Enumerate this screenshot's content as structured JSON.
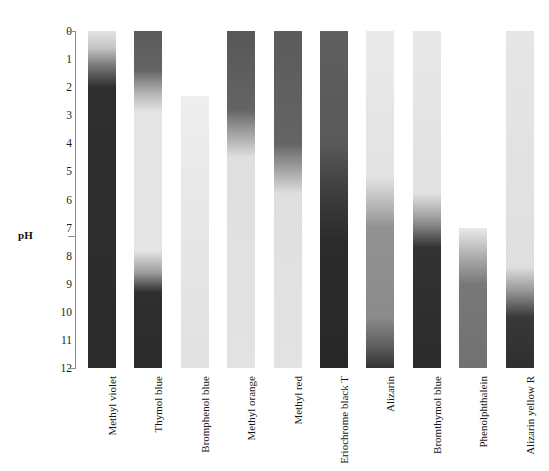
{
  "axis": {
    "title": "pH",
    "ticks": [
      "0",
      "1",
      "2",
      "3",
      "4",
      "5",
      "6",
      "7",
      "8",
      "9",
      "10",
      "11",
      "12"
    ],
    "min": 0,
    "max": 12,
    "capped_ticks": [
      "0",
      "7",
      "12"
    ]
  },
  "chart_data": {
    "type": "heatmap",
    "title": "pH",
    "xlabel": "",
    "ylabel": "pH",
    "ylim": [
      0,
      12
    ],
    "grid": false,
    "legend_position": "none",
    "orientation": "vertical-strips",
    "note": "Grayscale acid-base indicator strips; each strip shows a color (grayscale density) transition across its pH range. 0 = white/light form, 100 = dark form.",
    "categories": [
      "Methyl violet",
      "Thymol blue",
      "Bromphenol blue",
      "Methyl orange",
      "Methyl red",
      "Eriochrome black T",
      "Alizarin",
      "Bromthymol blue",
      "Phenolphthalein",
      "Alizarin yellow R"
    ],
    "series": [
      {
        "name": "Methyl violet",
        "ph_start": 0.0,
        "ph_end": 12.0,
        "transitions": [
          {
            "ph_low": 0.0,
            "ph_high": 2.0,
            "from_density": 8,
            "to_density": 92
          }
        ],
        "stops": [
          {
            "ph": 0.0,
            "density": 8
          },
          {
            "ph": 0.6,
            "density": 22
          },
          {
            "ph": 1.2,
            "density": 55
          },
          {
            "ph": 2.0,
            "density": 90
          },
          {
            "ph": 12.0,
            "density": 92
          }
        ]
      },
      {
        "name": "Thymol blue",
        "ph_start": 0.0,
        "ph_end": 12.0,
        "transitions": [
          {
            "ph_low": 1.2,
            "ph_high": 2.8,
            "from_density": 72,
            "to_density": 7
          },
          {
            "ph_low": 8.0,
            "ph_high": 9.4,
            "from_density": 7,
            "to_density": 92
          }
        ],
        "stops": [
          {
            "ph": 0.0,
            "density": 70
          },
          {
            "ph": 1.4,
            "density": 66
          },
          {
            "ph": 2.2,
            "density": 30
          },
          {
            "ph": 2.9,
            "density": 7
          },
          {
            "ph": 7.8,
            "density": 7
          },
          {
            "ph": 8.6,
            "density": 40
          },
          {
            "ph": 9.3,
            "density": 90
          },
          {
            "ph": 12.0,
            "density": 92
          }
        ]
      },
      {
        "name": "Bromphenol blue",
        "ph_start": 2.3,
        "ph_end": 12.0,
        "transitions": [
          {
            "ph_low": 3.0,
            "ph_high": 4.6,
            "from_density": 4,
            "to_density": 8
          }
        ],
        "stops": [
          {
            "ph": 2.3,
            "density": 3
          },
          {
            "ph": 6.0,
            "density": 6
          },
          {
            "ph": 12.0,
            "density": 9
          }
        ]
      },
      {
        "name": "Methyl orange",
        "ph_start": 0.0,
        "ph_end": 12.0,
        "transitions": [
          {
            "ph_low": 3.0,
            "ph_high": 4.5,
            "from_density": 72,
            "to_density": 8
          }
        ],
        "stops": [
          {
            "ph": 0.0,
            "density": 72
          },
          {
            "ph": 2.8,
            "density": 66
          },
          {
            "ph": 3.7,
            "density": 36
          },
          {
            "ph": 4.5,
            "density": 10
          },
          {
            "ph": 12.0,
            "density": 8
          }
        ]
      },
      {
        "name": "Methyl red",
        "ph_start": 0.0,
        "ph_end": 12.0,
        "transitions": [
          {
            "ph_low": 4.3,
            "ph_high": 5.8,
            "from_density": 70,
            "to_density": 8
          }
        ],
        "stops": [
          {
            "ph": 0.0,
            "density": 70
          },
          {
            "ph": 4.0,
            "density": 66
          },
          {
            "ph": 5.0,
            "density": 36
          },
          {
            "ph": 5.8,
            "density": 10
          },
          {
            "ph": 12.0,
            "density": 8
          }
        ]
      },
      {
        "name": "Eriochrome black T",
        "ph_start": 0.0,
        "ph_end": 12.0,
        "transitions": [
          {
            "ph_low": 4.5,
            "ph_high": 6.5,
            "from_density": 70,
            "to_density": 90
          }
        ],
        "stops": [
          {
            "ph": 0.0,
            "density": 68
          },
          {
            "ph": 4.0,
            "density": 71
          },
          {
            "ph": 6.0,
            "density": 85
          },
          {
            "ph": 7.5,
            "density": 92
          },
          {
            "ph": 12.0,
            "density": 93
          }
        ]
      },
      {
        "name": "Alizarin",
        "ph_start": 0.0,
        "ph_end": 12.0,
        "transitions": [
          {
            "ph_low": 5.5,
            "ph_high": 7.0,
            "from_density": 6,
            "to_density": 45
          },
          {
            "ph_low": 10.5,
            "ph_high": 12.0,
            "from_density": 48,
            "to_density": 85
          }
        ],
        "stops": [
          {
            "ph": 0.0,
            "density": 5
          },
          {
            "ph": 5.2,
            "density": 8
          },
          {
            "ph": 6.2,
            "density": 28
          },
          {
            "ph": 7.0,
            "density": 45
          },
          {
            "ph": 10.2,
            "density": 48
          },
          {
            "ph": 11.2,
            "density": 68
          },
          {
            "ph": 12.0,
            "density": 88
          }
        ]
      },
      {
        "name": "Bromthymol blue",
        "ph_start": 0.0,
        "ph_end": 12.0,
        "transitions": [
          {
            "ph_low": 6.0,
            "ph_high": 7.6,
            "from_density": 7,
            "to_density": 90
          }
        ],
        "stops": [
          {
            "ph": 0.0,
            "density": 6
          },
          {
            "ph": 5.8,
            "density": 9
          },
          {
            "ph": 6.8,
            "density": 45
          },
          {
            "ph": 7.7,
            "density": 88
          },
          {
            "ph": 12.0,
            "density": 92
          }
        ]
      },
      {
        "name": "Phenolphthalein",
        "ph_start": 7.0,
        "ph_end": 12.0,
        "transitions": [
          {
            "ph_low": 7.2,
            "ph_high": 9.0,
            "from_density": 6,
            "to_density": 58
          }
        ],
        "stops": [
          {
            "ph": 7.0,
            "density": 5
          },
          {
            "ph": 7.9,
            "density": 30
          },
          {
            "ph": 9.0,
            "density": 57
          },
          {
            "ph": 12.0,
            "density": 60
          }
        ]
      },
      {
        "name": "Alizarin yellow R",
        "ph_start": 0.0,
        "ph_end": 12.0,
        "transitions": [
          {
            "ph_low": 8.6,
            "ph_high": 10.1,
            "from_density": 8,
            "to_density": 88
          }
        ],
        "stops": [
          {
            "ph": 0.0,
            "density": 7
          },
          {
            "ph": 8.4,
            "density": 10
          },
          {
            "ph": 9.3,
            "density": 45
          },
          {
            "ph": 10.2,
            "density": 86
          },
          {
            "ph": 12.0,
            "density": 90
          }
        ]
      }
    ]
  },
  "colors": {
    "background": "#ffffff",
    "axis_line": "#8d8d8d",
    "text": "#1a1a1a",
    "strip_dark": "#1c1c1c",
    "strip_light": "#f2f2f2"
  }
}
